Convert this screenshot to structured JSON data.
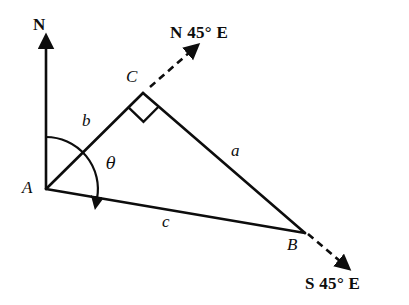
{
  "figure": {
    "title_visible": false,
    "background_color": "#ffffff",
    "stroke_color": "#0d0d0d",
    "width": 409,
    "height": 305,
    "type": "bearing-triangle-diagram"
  },
  "vertices": [
    {
      "id": "A",
      "label": "A",
      "x": 46,
      "y": 189,
      "label_x": 22,
      "label_y": 179
    },
    {
      "id": "B",
      "label": "B",
      "x": 305,
      "y": 233,
      "label_x": 287,
      "label_y": 236
    },
    {
      "id": "C",
      "label": "C",
      "x": 143,
      "y": 93,
      "label_x": 126,
      "label_y": 68
    }
  ],
  "sides": [
    {
      "id": "a",
      "label": "a",
      "from": "C",
      "to": "B",
      "label_x": 231,
      "label_y": 142
    },
    {
      "id": "b",
      "label": "b",
      "from": "A",
      "to": "C",
      "label_x": 82,
      "label_y": 112
    },
    {
      "id": "c",
      "label": "c",
      "from": "A",
      "to": "B",
      "label_x": 162,
      "label_y": 213
    }
  ],
  "compass": {
    "north_label": "N",
    "north_label_x": 33,
    "north_label_y": 16,
    "bearing_from_c": "N 45° E",
    "bearing_from_c_x": 170,
    "bearing_from_c_y": 24,
    "bearing_from_b": "S 45° E",
    "bearing_from_b_x": 305,
    "bearing_from_b_y": 275
  },
  "angle": {
    "symbol": "θ",
    "label_x": 106,
    "label_y": 156,
    "arc_radius": 52,
    "measured_from": "N",
    "measured_to": "c"
  },
  "markers": {
    "right_angle_at": "C",
    "right_angle_style": "square"
  }
}
